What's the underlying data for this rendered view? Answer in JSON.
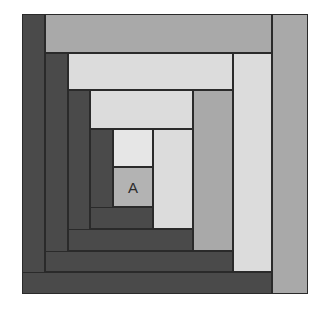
{
  "diagram": {
    "type": "log-cabin-quilt-block",
    "center_label": "A",
    "colors": {
      "dark": "#4a4a4a",
      "medium": "#a9a9a9",
      "light": "#dcdcdc",
      "lighter": "#e6e6e6",
      "center": "#b3b3b3",
      "outline": "#2a2a2a"
    },
    "pieces": [
      {
        "id": "right-1",
        "x": 272,
        "y": 14,
        "w": 36,
        "h": 280,
        "tone": "medium"
      },
      {
        "id": "top-1",
        "x": 45,
        "y": 14,
        "w": 227,
        "h": 39,
        "tone": "medium"
      },
      {
        "id": "left-1",
        "x": 22,
        "y": 14,
        "w": 23,
        "h": 280,
        "tone": "dark"
      },
      {
        "id": "bottom-1",
        "x": 22,
        "y": 272,
        "w": 250,
        "h": 22,
        "tone": "dark"
      },
      {
        "id": "right-2",
        "x": 233,
        "y": 53,
        "w": 39,
        "h": 219,
        "tone": "light"
      },
      {
        "id": "top-2",
        "x": 68,
        "y": 53,
        "w": 165,
        "h": 37,
        "tone": "light"
      },
      {
        "id": "left-2",
        "x": 45,
        "y": 53,
        "w": 23,
        "h": 219,
        "tone": "dark"
      },
      {
        "id": "bottom-2",
        "x": 45,
        "y": 251,
        "w": 188,
        "h": 21,
        "tone": "dark"
      },
      {
        "id": "right-3",
        "x": 193,
        "y": 90,
        "w": 40,
        "h": 161,
        "tone": "medium"
      },
      {
        "id": "top-3",
        "x": 90,
        "y": 90,
        "w": 103,
        "h": 39,
        "tone": "light"
      },
      {
        "id": "left-3",
        "x": 68,
        "y": 90,
        "w": 22,
        "h": 161,
        "tone": "dark"
      },
      {
        "id": "bottom-3",
        "x": 68,
        "y": 229,
        "w": 125,
        "h": 22,
        "tone": "dark"
      },
      {
        "id": "right-4",
        "x": 153,
        "y": 129,
        "w": 40,
        "h": 100,
        "tone": "light"
      },
      {
        "id": "top-4",
        "x": 113,
        "y": 129,
        "w": 40,
        "h": 38,
        "tone": "lighter"
      },
      {
        "id": "left-4",
        "x": 90,
        "y": 129,
        "w": 23,
        "h": 100,
        "tone": "dark"
      },
      {
        "id": "bottom-4",
        "x": 90,
        "y": 207,
        "w": 63,
        "h": 22,
        "tone": "dark"
      },
      {
        "id": "center-a",
        "x": 113,
        "y": 167,
        "w": 40,
        "h": 40,
        "tone": "center"
      }
    ]
  }
}
